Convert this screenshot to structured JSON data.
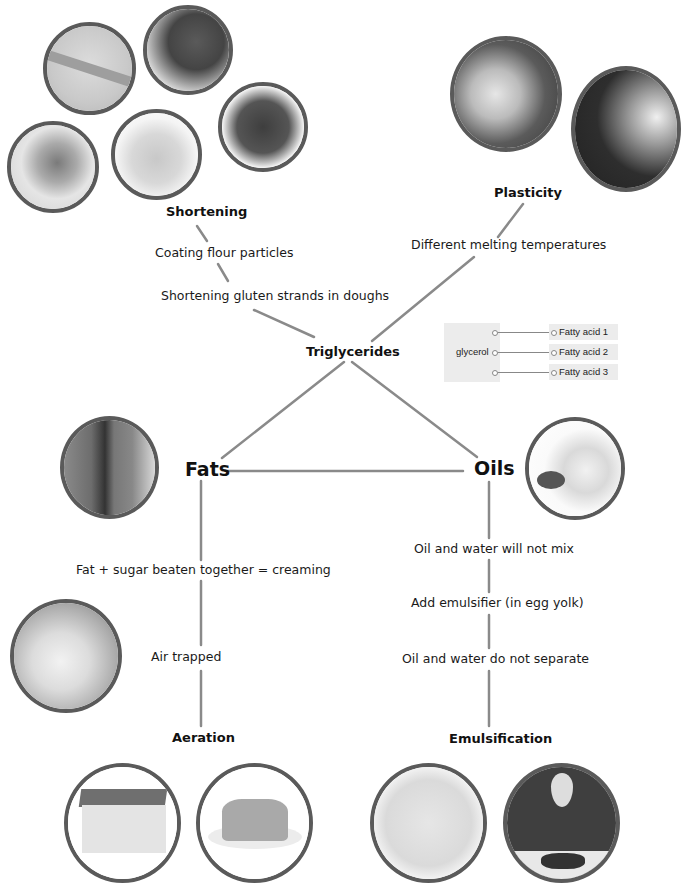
{
  "nodes": {
    "shortening": "Shortening",
    "plasticity": "Plasticity",
    "triglycerides": "Triglycerides",
    "fats": "Fats",
    "oils": "Oils",
    "aeration": "Aeration",
    "emulsification": "Emulsification"
  },
  "labels": {
    "coating": "Coating flour particles",
    "gluten": "Shortening gluten strands in doughs",
    "melting": "Different melting temperatures",
    "creaming": "Fat + sugar beaten together = creaming",
    "air": "Air trapped",
    "not_mix": "Oil and water will not mix",
    "emulsifier": "Add emulsifier (in egg yolk)",
    "not_separate": "Oil and water do not separate"
  },
  "glycerol_diagram": {
    "glycerol": "glycerol",
    "fatty_acids": [
      "Fatty acid 1",
      "Fatty acid 2",
      "Fatty acid 3"
    ]
  },
  "photos": {
    "pastry": "pastry-dough-photo",
    "bread": "fruit-bread-photo",
    "cookies": "chocolate-chip-cookies-photo",
    "crumble": "crumble-pot-photo",
    "shortbread": "shortbread-fingers-photo",
    "butter_bread": "buttered-bread-photo",
    "cupcakes": "piping-cupcakes-photo",
    "butter_block": "fat-block-photo",
    "oil_jug": "oil-jug-photo",
    "creaming_bowl": "creaming-bowl-photo",
    "sponge_cake": "sponge-cake-photo",
    "sponge_pudding": "sponge-pudding-photo",
    "mayonnaise": "mayonnaise-bowl-photo",
    "cream_pour": "pouring-cream-photo"
  },
  "colors": {
    "line": "#8a8a8a",
    "photo_border": "#5a5a5a",
    "box_bg": "#ececec"
  }
}
